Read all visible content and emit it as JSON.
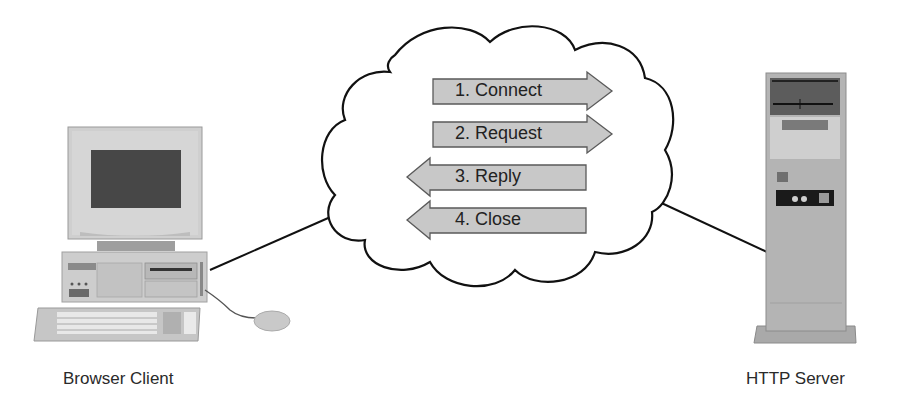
{
  "diagram": {
    "client": {
      "label": "Browser Client",
      "icon": "desktop-computer-icon"
    },
    "server": {
      "label": "HTTP Server",
      "icon": "tower-server-icon"
    },
    "network": {
      "icon": "cloud-icon"
    },
    "steps": [
      {
        "label": "1. Connect",
        "direction": "right"
      },
      {
        "label": "2. Request",
        "direction": "right"
      },
      {
        "label": "3. Reply",
        "direction": "left"
      },
      {
        "label": "4. Close",
        "direction": "left"
      }
    ],
    "colors": {
      "arrow_fill": "#c8c8c8",
      "arrow_stroke": "#5a5a5a",
      "line": "#111111",
      "device_body": "#c9c9c9",
      "device_dark": "#4a4a4a"
    }
  }
}
